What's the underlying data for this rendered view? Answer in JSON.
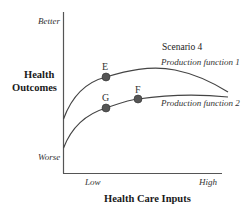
{
  "diagram": {
    "y_axis": {
      "title_line1": "Health",
      "title_line2": "Outcomes",
      "top_label": "Better",
      "bottom_label": "Worse"
    },
    "x_axis": {
      "title": "Health Care Inputs",
      "left_label": "Low",
      "right_label": "High"
    },
    "scenario_label": "Scenario 4",
    "curves": [
      {
        "name": "Production function 1",
        "label": "Production function 1"
      },
      {
        "name": "Production function 2",
        "label": "Production function 2"
      }
    ],
    "points": [
      {
        "label": "E",
        "curve": "Production function 1",
        "x": 106,
        "y": 77
      },
      {
        "label": "G",
        "curve": "Production function 2",
        "x": 106,
        "y": 108
      },
      {
        "label": "F",
        "curve": "Production function 2",
        "x": 138,
        "y": 99
      }
    ],
    "colors": {
      "axis": "#555555",
      "curve": "#444444",
      "point": "#555555"
    }
  }
}
